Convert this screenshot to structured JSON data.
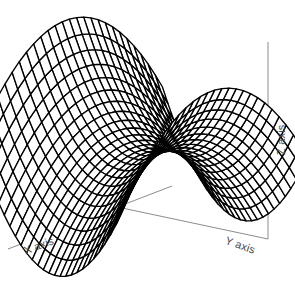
{
  "figure": {
    "title": "",
    "background_color": "#ffffff",
    "width": 295,
    "height": 283
  },
  "axes": {
    "x": {
      "label": "X axis",
      "line_color": "#8c8c8c",
      "start": [
        8,
        249
      ],
      "end": [
        172,
        186
      ]
    },
    "y": {
      "label": "Y axis",
      "line_color": "#8c8c8c",
      "start": [
        108,
        205
      ],
      "end": [
        268,
        239
      ]
    },
    "z": {
      "label": "Z axis",
      "line_color": "#8c8c8c",
      "start": [
        268,
        42
      ],
      "end": [
        268,
        239
      ]
    }
  },
  "chart_data": {
    "type": "surface",
    "title": "",
    "xlabel": "X axis",
    "ylabel": "Y axis",
    "zlabel": "Z axis",
    "surface_function": "z = x^2 - y^2",
    "mesh": {
      "line_color": "#000000",
      "face_color": "#ffffff",
      "u_divisions": 26,
      "v_divisions": 26,
      "u_range": [
        -1,
        1
      ],
      "v_range": [
        -1,
        1
      ],
      "show_grid": true,
      "shading": "wireframe"
    },
    "projection": {
      "type": "oblique",
      "elevation_deg": 28,
      "azimuth_deg": -52,
      "center_x": 142,
      "center_y": 150,
      "scale_x": 118,
      "scale_y": 96,
      "scale_z": 108
    },
    "xlim": [
      -1,
      1
    ],
    "ylim": [
      -1,
      1
    ],
    "zlim": [
      -1,
      1
    ],
    "tick_labels_visible": false,
    "legend": null,
    "annotations": []
  }
}
